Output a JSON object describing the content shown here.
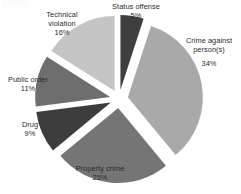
{
  "chart_data": {
    "type": "pie",
    "title": "",
    "categories": [
      "Status offense",
      "Crime against person(s)",
      "Property crime",
      "Drug",
      "Public order",
      "Technical violation"
    ],
    "values": [
      5,
      34,
      25,
      9,
      11,
      16
    ],
    "value_unit": "%",
    "exploded": true,
    "legend": "none",
    "labels_position": "outside",
    "slice_colors": [
      "#3f3f3f",
      "#a9a9a9",
      "#757575",
      "#3d3d3d",
      "#6e6e6e",
      "#c4c4c4"
    ],
    "slices": [
      {
        "name": "Status offense",
        "value": 5,
        "pct_label": "5%",
        "color": "#3f3f3f"
      },
      {
        "name": "Crime against person(s)",
        "value": 34,
        "pct_label": "34%",
        "color": "#a9a9a9"
      },
      {
        "name": "Property crime",
        "value": 25,
        "pct_label": "25%",
        "color": "#757575"
      },
      {
        "name": "Drug",
        "value": 9,
        "pct_label": "9%",
        "color": "#3d3d3d"
      },
      {
        "name": "Public order",
        "value": 11,
        "pct_label": "11%",
        "color": "#6e6e6e"
      },
      {
        "name": "Technical violation",
        "value": 16,
        "pct_label": "16%",
        "color": "#c4c4c4"
      }
    ]
  },
  "labels": {
    "status_offense": {
      "name": "Status offense",
      "pct": "5%"
    },
    "crime_person": {
      "name": "Crime against person(s)",
      "pct": "34%"
    },
    "property_crime": {
      "name": "Property crime",
      "pct": "25%"
    },
    "drug": {
      "name": "Drug",
      "pct": "9%"
    },
    "public_order": {
      "name": "Public order",
      "pct": "11%"
    },
    "technical": {
      "name_line1": "Technical",
      "name_line2": "violation",
      "pct": "16%"
    }
  }
}
